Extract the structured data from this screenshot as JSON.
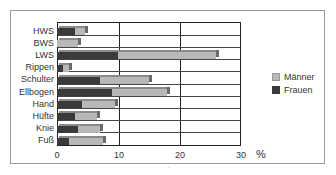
{
  "chart_data": {
    "type": "bar",
    "orientation": "horizontal",
    "stacked": true,
    "title": "",
    "xlabel": "%",
    "ylabel": "",
    "xlim": [
      0,
      30
    ],
    "x_ticks": [
      "0",
      "10",
      "20",
      "30"
    ],
    "grid": true,
    "legend_position": "right",
    "categories": [
      "HWS",
      "BWS",
      "LWS",
      "Rippen",
      "Schulter",
      "Ellbogen",
      "Hand",
      "Hüfte",
      "Knie",
      "Fuß"
    ],
    "series": [
      {
        "name": "Frauen",
        "color": "#3a3a3a",
        "values": [
          3,
          0,
          10,
          1,
          7,
          9,
          4,
          3,
          3.5,
          2
        ]
      },
      {
        "name": "Männer",
        "color": "#b8b8b8",
        "values": [
          1.5,
          3.5,
          16,
          1,
          8,
          9,
          5.5,
          3.5,
          3.5,
          5.5
        ]
      }
    ],
    "totals": [
      4.5,
      3.5,
      26,
      2,
      15,
      18,
      9.5,
      6.5,
      7,
      7.5
    ]
  },
  "axis": {
    "unit": "%",
    "ticks": [
      "0",
      "10",
      "20",
      "30"
    ]
  },
  "legend": [
    {
      "label": "Männer",
      "color": "#b8b8b8"
    },
    {
      "label": "Frauen",
      "color": "#3a3a3a"
    }
  ],
  "footer_mark": "¨"
}
